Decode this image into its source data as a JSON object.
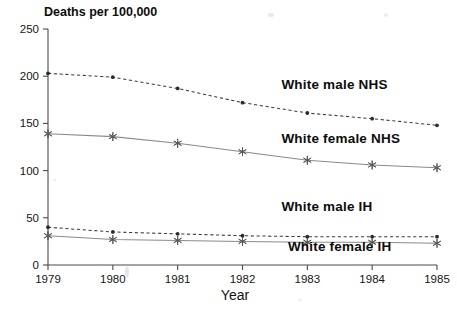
{
  "chart_data": {
    "type": "line",
    "title": "Deaths per 100,000",
    "xlabel": "Year",
    "ylabel": "Deaths per 100,000",
    "categories": [
      1979,
      1980,
      1981,
      1982,
      1983,
      1984,
      1985
    ],
    "x": [
      "1979",
      "1980",
      "1981",
      "1982",
      "1983",
      "1984",
      "1985"
    ],
    "xlim": [
      1979,
      1985
    ],
    "ylim": [
      0,
      250
    ],
    "yticks": [
      0,
      50,
      100,
      150,
      200,
      250
    ],
    "xticks": [
      "1979",
      "1980",
      "1981",
      "1982",
      "1983",
      "1984",
      "1985"
    ],
    "grid": false,
    "legend": "inline-annotations",
    "series": [
      {
        "name": "White male NHS",
        "values": [
          203,
          199,
          187,
          172,
          161,
          155,
          148
        ],
        "style": "dashed",
        "marker": "dot",
        "label_x": 1982.6,
        "label_y": 186
      },
      {
        "name": "White female NHS",
        "values": [
          139,
          136,
          129,
          120,
          111,
          106,
          103
        ],
        "style": "solid",
        "marker": "star",
        "label_x": 1982.6,
        "label_y": 129
      },
      {
        "name": "White male IH",
        "values": [
          40,
          35,
          33,
          31,
          30,
          30,
          30
        ],
        "style": "dashed",
        "marker": "dot",
        "label_x": 1982.6,
        "label_y": 57
      },
      {
        "name": "White female IH",
        "values": [
          31,
          27,
          26,
          25,
          24,
          24,
          23
        ],
        "style": "solid",
        "marker": "star",
        "label_x": 1982.7,
        "label_y": 15
      }
    ]
  },
  "axes": {
    "y_tick_labels": [
      "250",
      "200",
      "150",
      "100",
      "50",
      "0"
    ],
    "x_tick_labels": [
      "1979",
      "1980",
      "1981",
      "1982",
      "1983",
      "1984",
      "1985"
    ],
    "y_axis_title": "Deaths per 100,000",
    "x_axis_title": "Year"
  },
  "series_labels": {
    "white_male_nhs": "White male NHS",
    "white_female_nhs": "White female NHS",
    "white_male_ih": "White male IH",
    "white_female_ih": "White female IH"
  },
  "colors": {
    "axis": "#4a4a4a",
    "dashed_series": "#3d3d3d",
    "solid_series": "#8a8a8a",
    "text": "#111111",
    "background": "#ffffff"
  }
}
